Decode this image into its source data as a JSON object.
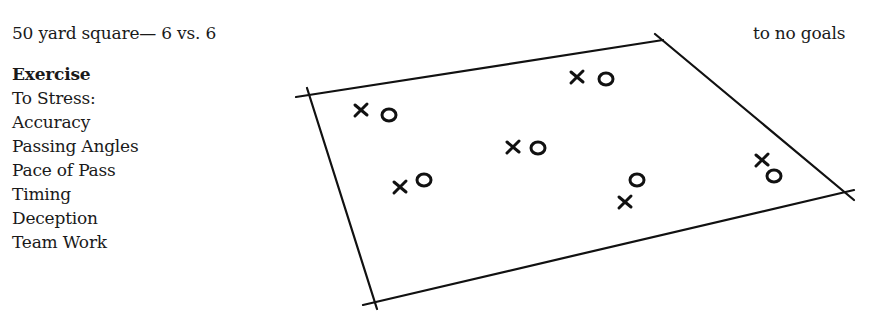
{
  "header": {
    "title": "50 yard square— 6 vs. 6",
    "note": "to no goals"
  },
  "exercise": {
    "heading": "Exercise",
    "subheading": "To Stress:",
    "items": [
      "Accuracy",
      "Passing Angles",
      "Pace of Pass",
      "Timing",
      "Deception",
      "Team Work"
    ]
  },
  "diagram": {
    "field_corners": {
      "top_left": [
        310,
        93
      ],
      "top_right": [
        663,
        40
      ],
      "bottom_right": [
        848,
        193
      ],
      "bottom_left": [
        375,
        302
      ]
    },
    "pairs": [
      {
        "x_marker": [
          361,
          110
        ],
        "o_marker": [
          389,
          115
        ]
      },
      {
        "x_marker": [
          577,
          77
        ],
        "o_marker": [
          606,
          79
        ]
      },
      {
        "x_marker": [
          513,
          147
        ],
        "o_marker": [
          538,
          148
        ]
      },
      {
        "x_marker": [
          400,
          187
        ],
        "o_marker": [
          424,
          180
        ]
      },
      {
        "x_marker": [
          625,
          202
        ],
        "o_marker": [
          637,
          180
        ]
      },
      {
        "x_marker": [
          762,
          160
        ],
        "o_marker": [
          774,
          176
        ]
      }
    ],
    "legend": {
      "x": "player team X",
      "o": "player team O"
    }
  }
}
